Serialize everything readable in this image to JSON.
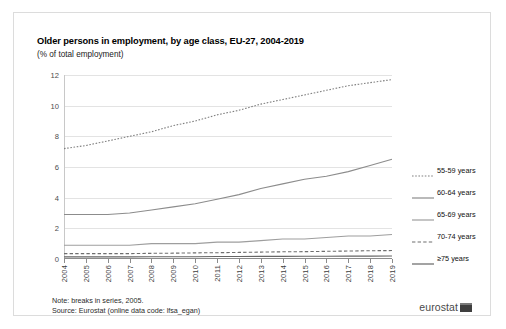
{
  "figure": {
    "title": "Older persons in employment, by age class, EU-27, 2004-2019",
    "subtitle": "(% of total employment)",
    "note": "Note: breaks in series, 2005.",
    "source": "Source: Eurostat (online data code: lfsa_egan)",
    "brand": "eurostat",
    "brand_mark": "eurostat-logo-mark"
  },
  "chart_data": {
    "type": "line",
    "title": "Older persons in employment, by age class, EU-27, 2004-2019",
    "xlabel": "",
    "ylabel": "(% of total employment)",
    "ylim": [
      0,
      12
    ],
    "yticks": [
      0,
      2,
      4,
      6,
      8,
      10,
      12
    ],
    "grid": true,
    "legend_position": "right",
    "categories": [
      "2004",
      "2005",
      "2006",
      "2007",
      "2008",
      "2009",
      "2010",
      "2011",
      "2012",
      "2013",
      "2014",
      "2015",
      "2016",
      "2017",
      "2018",
      "2019"
    ],
    "series": [
      {
        "name": "55-59 years",
        "style": "dotted",
        "color": "#808080",
        "values": [
          7.2,
          7.4,
          7.7,
          8.0,
          8.3,
          8.7,
          9.0,
          9.4,
          9.7,
          10.1,
          10.4,
          10.7,
          11.0,
          11.3,
          11.5,
          11.7
        ]
      },
      {
        "name": "60-64 years",
        "style": "solid",
        "color": "#8c8c8c",
        "values": [
          2.9,
          2.9,
          2.9,
          3.0,
          3.2,
          3.4,
          3.6,
          3.9,
          4.2,
          4.6,
          4.9,
          5.2,
          5.4,
          5.7,
          6.1,
          6.5
        ]
      },
      {
        "name": "65-69 years",
        "style": "solid",
        "color": "#9e9e9e",
        "values": [
          0.9,
          0.9,
          0.9,
          0.9,
          1.0,
          1.0,
          1.0,
          1.1,
          1.1,
          1.2,
          1.3,
          1.3,
          1.4,
          1.5,
          1.5,
          1.6
        ]
      },
      {
        "name": "70-74 years",
        "style": "dashed",
        "color": "#6e6e6e",
        "values": [
          0.35,
          0.35,
          0.35,
          0.35,
          0.37,
          0.38,
          0.4,
          0.41,
          0.43,
          0.45,
          0.47,
          0.48,
          0.5,
          0.52,
          0.54,
          0.55
        ]
      },
      {
        "name": "≥75 years",
        "style": "solid",
        "color": "#666666",
        "values": [
          0.14,
          0.14,
          0.14,
          0.14,
          0.15,
          0.15,
          0.15,
          0.16,
          0.16,
          0.17,
          0.17,
          0.18,
          0.18,
          0.19,
          0.19,
          0.2
        ]
      }
    ]
  }
}
